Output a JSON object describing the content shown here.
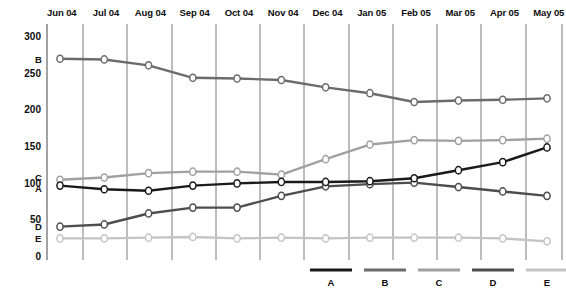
{
  "chart_data": {
    "type": "line",
    "title": "",
    "subtitle": "",
    "xlabel": "",
    "ylabel": "",
    "grid": "vertical-only",
    "legend_position": "bottom-right",
    "ylim": [
      0,
      300
    ],
    "yticks": [
      "0",
      "50",
      "100",
      "150",
      "200",
      "250",
      "300"
    ],
    "ytick_values": [
      0,
      50,
      100,
      150,
      200,
      250,
      300
    ],
    "categories": [
      "Jun 04",
      "Jul 04",
      "Aug 04",
      "Sep 04",
      "Oct 04",
      "Nov 04",
      "Dec 04",
      "Jan 05",
      "Feb 05",
      "Mar 05",
      "Apr 05",
      "May 05"
    ],
    "series": [
      {
        "name": "A",
        "color": "#1a1a1a",
        "inline_label": "A",
        "values": [
          96,
          91,
          89,
          96,
          99,
          101,
          101,
          102,
          106,
          117,
          128,
          148
        ]
      },
      {
        "name": "B",
        "color": "#6b6b6b",
        "inline_label": "B",
        "values": [
          269,
          268,
          260,
          243,
          242,
          240,
          230,
          222,
          210,
          212,
          213,
          215
        ]
      },
      {
        "name": "C",
        "color": "#a0a0a0",
        "inline_label": "C",
        "values": [
          104,
          107,
          113,
          115,
          115,
          111,
          132,
          152,
          158,
          157,
          158,
          160
        ]
      },
      {
        "name": "D",
        "color": "#4d4d4d",
        "inline_label": "D",
        "values": [
          40,
          43,
          58,
          66,
          66,
          82,
          95,
          98,
          100,
          94,
          88,
          82
        ]
      },
      {
        "name": "E",
        "color": "#c4c4c4",
        "inline_label": "E",
        "values": [
          24,
          24,
          25,
          26,
          24,
          25,
          24,
          25,
          25,
          25,
          24,
          20
        ]
      }
    ],
    "legend": [
      {
        "label": "A",
        "color": "#1a1a1a"
      },
      {
        "label": "B",
        "color": "#6b6b6b"
      },
      {
        "label": "C",
        "color": "#a0a0a0"
      },
      {
        "label": "D",
        "color": "#4d4d4d"
      },
      {
        "label": "E",
        "color": "#c4c4c4"
      }
    ]
  },
  "axis": {
    "y_labels": [
      "300",
      "250",
      "200",
      "150",
      "100",
      "50",
      "0"
    ],
    "x_labels": [
      "Jun 04",
      "Jul 04",
      "Aug 04",
      "Sep 04",
      "Oct 04",
      "Nov 04",
      "Dec 04",
      "Jan 05",
      "Feb 05",
      "Mar 05",
      "Apr 05",
      "May 05"
    ]
  },
  "inline_labels": [
    {
      "text": "B",
      "y": 269
    },
    {
      "text": "C",
      "y": 108
    },
    {
      "text": "A",
      "y": 93
    },
    {
      "text": "D",
      "y": 41
    },
    {
      "text": "E",
      "y": 24
    }
  ]
}
